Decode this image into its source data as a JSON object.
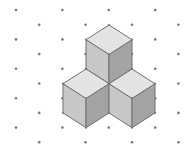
{
  "figure": {
    "colors": {
      "background": "#ffffff",
      "dot": "#777777",
      "edge": "#6e6e6e",
      "top_face": "#e4e4e4",
      "left_face": "#c8c8c8",
      "right_face": "#a4a4a4"
    },
    "grid": {
      "x_step": 23.2,
      "y_step": 14.7,
      "origin_x": 16,
      "origin_y": 10,
      "cols": 8,
      "rows": 10
    },
    "cubes": [
      {
        "name": "top-cube",
        "top": [
          109,
          25
        ],
        "size_x": 23,
        "size_y": 14.7,
        "height": 29.3
      },
      {
        "name": "left-cube",
        "top": [
          86,
          69
        ],
        "size_x": 23,
        "size_y": 14.7,
        "height": 29.3
      },
      {
        "name": "right-cube",
        "top": [
          132,
          69
        ],
        "size_x": 23,
        "size_y": 14.7,
        "height": 29.3
      }
    ]
  }
}
